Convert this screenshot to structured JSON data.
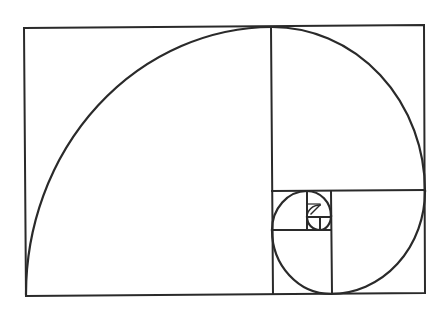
{
  "diagram": {
    "title": "Golden spiral",
    "stroke_color": "#2a2a2a",
    "background": "#ffffff",
    "outer_rect": {
      "x1": 24,
      "y1": 27,
      "x2": 425,
      "y2": 294
    },
    "divider_lines": [
      {
        "x1": 272,
        "y1": 27,
        "x2": 272,
        "y2": 294
      },
      {
        "x1": 272,
        "y1": 191,
        "x2": 425,
        "y2": 191
      },
      {
        "x1": 331,
        "y1": 191,
        "x2": 331,
        "y2": 294
      },
      {
        "x1": 272,
        "y1": 230,
        "x2": 331,
        "y2": 230
      },
      {
        "x1": 307,
        "y1": 191,
        "x2": 307,
        "y2": 230
      },
      {
        "x1": 307,
        "y1": 216,
        "x2": 331,
        "y2": 216
      },
      {
        "x1": 320,
        "y1": 216,
        "x2": 320,
        "y2": 230
      }
    ]
  }
}
